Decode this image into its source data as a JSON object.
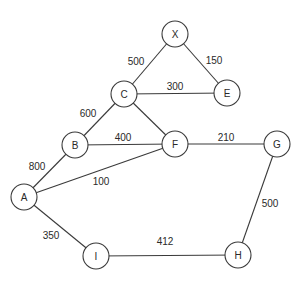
{
  "graph": {
    "nodes": [
      {
        "id": "X",
        "label": "X",
        "x": 175,
        "y": 34
      },
      {
        "id": "C",
        "label": "C",
        "x": 124,
        "y": 94
      },
      {
        "id": "E",
        "label": "E",
        "x": 227,
        "y": 93
      },
      {
        "id": "B",
        "label": "B",
        "x": 75,
        "y": 145
      },
      {
        "id": "F",
        "label": "F",
        "x": 175,
        "y": 144
      },
      {
        "id": "G",
        "label": "G",
        "x": 277,
        "y": 144
      },
      {
        "id": "A",
        "label": "A",
        "x": 24,
        "y": 197
      },
      {
        "id": "I",
        "label": "I",
        "x": 96,
        "y": 256
      },
      {
        "id": "H",
        "label": "H",
        "x": 238,
        "y": 255
      }
    ],
    "edges": [
      {
        "from": "X",
        "to": "C",
        "weight": "500",
        "lx": 136,
        "ly": 61
      },
      {
        "from": "X",
        "to": "E",
        "weight": "150",
        "lx": 214,
        "ly": 60
      },
      {
        "from": "C",
        "to": "E",
        "weight": "300",
        "lx": 175,
        "ly": 86
      },
      {
        "from": "C",
        "to": "B",
        "weight": "600",
        "lx": 88,
        "ly": 113
      },
      {
        "from": "C",
        "to": "F",
        "weight": "",
        "lx": 0,
        "ly": 0
      },
      {
        "from": "B",
        "to": "F",
        "weight": "400",
        "lx": 123,
        "ly": 137
      },
      {
        "from": "F",
        "to": "G",
        "weight": "210",
        "lx": 226,
        "ly": 137
      },
      {
        "from": "A",
        "to": "B",
        "weight": "800",
        "lx": 37,
        "ly": 166
      },
      {
        "from": "A",
        "to": "F",
        "weight": "100",
        "lx": 101,
        "ly": 181
      },
      {
        "from": "A",
        "to": "I",
        "weight": "350",
        "lx": 51,
        "ly": 235
      },
      {
        "from": "I",
        "to": "H",
        "weight": "412",
        "lx": 165,
        "ly": 241
      },
      {
        "from": "G",
        "to": "H",
        "weight": "500",
        "lx": 270,
        "ly": 203
      }
    ],
    "node_radius": 13
  }
}
